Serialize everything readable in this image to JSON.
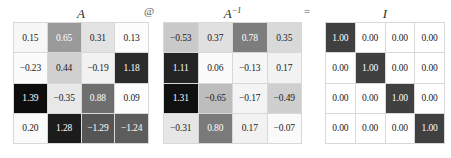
{
  "chart_data": {
    "type": "heatmap",
    "title": "",
    "layout": "A @ A^-1 = I",
    "colormap": "grayscale",
    "value_format": "2-decimal",
    "matrices": [
      {
        "name": "A",
        "label": "A",
        "label_superscript": "",
        "rows": 4,
        "cols": 4,
        "values": [
          [
            0.15,
            0.65,
            0.31,
            0.13
          ],
          [
            -0.23,
            0.44,
            -0.19,
            1.18
          ],
          [
            1.39,
            -0.35,
            0.88,
            0.09
          ],
          [
            0.2,
            1.28,
            -1.29,
            -1.24
          ]
        ],
        "cells": [
          [
            {
              "text": "0.15",
              "bg": "#f7f7f7",
              "fg": "#1a1a1a"
            },
            {
              "text": "0.65",
              "bg": "#9a9a9a",
              "fg": "#ffffff"
            },
            {
              "text": "0.31",
              "bg": "#e3e3e3",
              "fg": "#1a1a1a"
            },
            {
              "text": "0.13",
              "bg": "#fcfcfc",
              "fg": "#1a1a1a"
            }
          ],
          [
            {
              "text": "−0.23",
              "bg": "#fbfbfb",
              "fg": "#1a1a1a"
            },
            {
              "text": "0.44",
              "bg": "#d0d0d0",
              "fg": "#1a1a1a"
            },
            {
              "text": "−0.19",
              "bg": "#f2f2f2",
              "fg": "#1a1a1a"
            },
            {
              "text": "1.18",
              "bg": "#2b2b2b",
              "fg": "#ffffff"
            }
          ],
          [
            {
              "text": "1.39",
              "bg": "#0d0d0d",
              "fg": "#ffffff"
            },
            {
              "text": "−0.35",
              "bg": "#e8e8e8",
              "fg": "#1a1a1a"
            },
            {
              "text": "0.88",
              "bg": "#6e6e6e",
              "fg": "#ffffff"
            },
            {
              "text": "0.09",
              "bg": "#fdfdfd",
              "fg": "#1a1a1a"
            }
          ],
          [
            {
              "text": "0.20",
              "bg": "#fafafa",
              "fg": "#1a1a1a"
            },
            {
              "text": "1.28",
              "bg": "#1c1c1c",
              "fg": "#ffffff"
            },
            {
              "text": "−1.29",
              "bg": "#555555",
              "fg": "#ffffff"
            },
            {
              "text": "−1.24",
              "bg": "#5d5d5d",
              "fg": "#ffffff"
            }
          ]
        ]
      },
      {
        "name": "A_inverse",
        "label": "A",
        "label_superscript": "−1",
        "rows": 4,
        "cols": 4,
        "values": [
          [
            -0.53,
            0.37,
            0.78,
            0.35
          ],
          [
            1.11,
            0.06,
            -0.13,
            0.17
          ],
          [
            1.31,
            -0.65,
            -0.17,
            -0.49
          ],
          [
            -0.31,
            0.8,
            0.17,
            -0.07
          ]
        ],
        "cells": [
          [
            {
              "text": "−0.53",
              "bg": "#c9c9c9",
              "fg": "#1a1a1a"
            },
            {
              "text": "0.37",
              "bg": "#e0e0e0",
              "fg": "#1a1a1a"
            },
            {
              "text": "0.78",
              "bg": "#7d7d7d",
              "fg": "#ffffff"
            },
            {
              "text": "0.35",
              "bg": "#d9d9d9",
              "fg": "#1a1a1a"
            }
          ],
          [
            {
              "text": "1.11",
              "bg": "#242424",
              "fg": "#ffffff"
            },
            {
              "text": "0.06",
              "bg": "#fbfbfb",
              "fg": "#1a1a1a"
            },
            {
              "text": "−0.13",
              "bg": "#f6f6f6",
              "fg": "#1a1a1a"
            },
            {
              "text": "0.17",
              "bg": "#f2f2f2",
              "fg": "#1a1a1a"
            }
          ],
          [
            {
              "text": "1.31",
              "bg": "#101010",
              "fg": "#ffffff"
            },
            {
              "text": "−0.65",
              "bg": "#bdbdbd",
              "fg": "#1a1a1a"
            },
            {
              "text": "−0.17",
              "bg": "#f4f4f4",
              "fg": "#1a1a1a"
            },
            {
              "text": "−0.49",
              "bg": "#cfcfcf",
              "fg": "#1a1a1a"
            }
          ],
          [
            {
              "text": "−0.31",
              "bg": "#e6e6e6",
              "fg": "#1a1a1a"
            },
            {
              "text": "0.80",
              "bg": "#7a7a7a",
              "fg": "#ffffff"
            },
            {
              "text": "0.17",
              "bg": "#f2f2f2",
              "fg": "#1a1a1a"
            },
            {
              "text": "−0.07",
              "bg": "#fafafa",
              "fg": "#1a1a1a"
            }
          ]
        ]
      },
      {
        "name": "I",
        "label": "I",
        "label_superscript": "",
        "rows": 4,
        "cols": 4,
        "values": [
          [
            1.0,
            0.0,
            0.0,
            0.0
          ],
          [
            0.0,
            1.0,
            0.0,
            0.0
          ],
          [
            0.0,
            0.0,
            1.0,
            0.0
          ],
          [
            0.0,
            0.0,
            0.0,
            1.0
          ]
        ],
        "cells": [
          [
            {
              "text": "1.00",
              "bg": "#404040",
              "fg": "#ffffff"
            },
            {
              "text": "0.00",
              "bg": "#ffffff",
              "fg": "#1a1a1a"
            },
            {
              "text": "0.00",
              "bg": "#ffffff",
              "fg": "#1a1a1a"
            },
            {
              "text": "0.00",
              "bg": "#ffffff",
              "fg": "#1a1a1a"
            }
          ],
          [
            {
              "text": "0.00",
              "bg": "#ffffff",
              "fg": "#1a1a1a"
            },
            {
              "text": "1.00",
              "bg": "#404040",
              "fg": "#ffffff"
            },
            {
              "text": "0.00",
              "bg": "#ffffff",
              "fg": "#1a1a1a"
            },
            {
              "text": "0.00",
              "bg": "#ffffff",
              "fg": "#1a1a1a"
            }
          ],
          [
            {
              "text": "0.00",
              "bg": "#ffffff",
              "fg": "#1a1a1a"
            },
            {
              "text": "0.00",
              "bg": "#ffffff",
              "fg": "#1a1a1a"
            },
            {
              "text": "1.00",
              "bg": "#404040",
              "fg": "#ffffff"
            },
            {
              "text": "0.00",
              "bg": "#ffffff",
              "fg": "#1a1a1a"
            }
          ],
          [
            {
              "text": "0.00",
              "bg": "#ffffff",
              "fg": "#1a1a1a"
            },
            {
              "text": "0.00",
              "bg": "#ffffff",
              "fg": "#1a1a1a"
            },
            {
              "text": "0.00",
              "bg": "#ffffff",
              "fg": "#1a1a1a"
            },
            {
              "text": "1.00",
              "bg": "#404040",
              "fg": "#ffffff"
            }
          ]
        ]
      }
    ],
    "operators": [
      {
        "name": "matmul",
        "symbol": "@"
      },
      {
        "name": "equals",
        "symbol": "="
      }
    ]
  }
}
